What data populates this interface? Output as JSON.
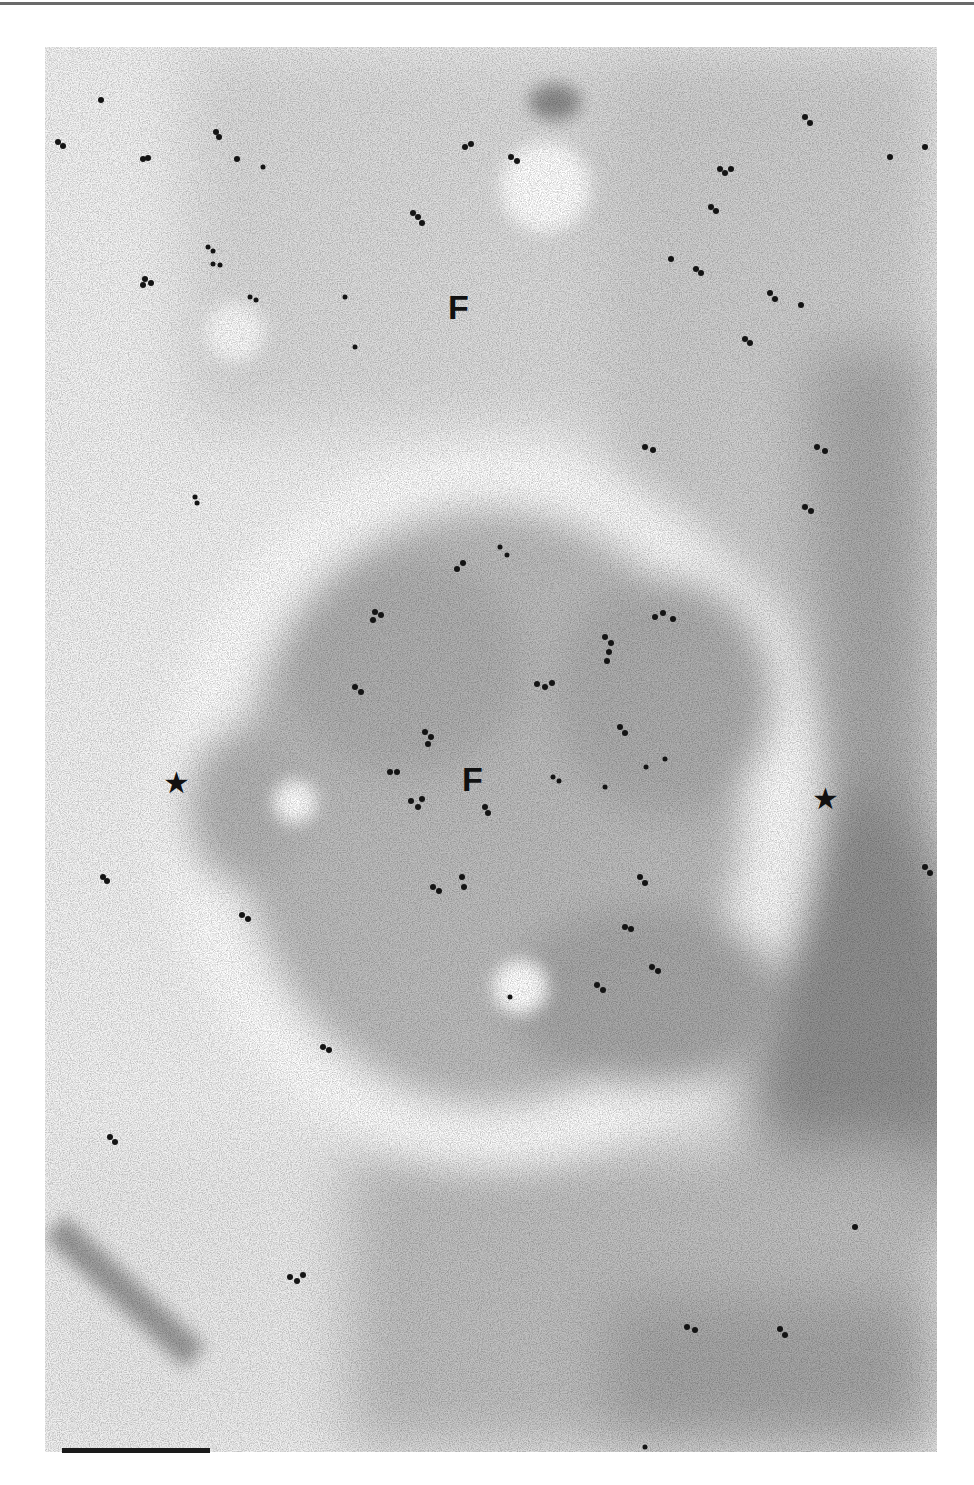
{
  "figure": {
    "type": "immunogold electron micrograph",
    "labels": [
      {
        "id": "label-f-top",
        "text": "F",
        "x": 448,
        "y": 290
      },
      {
        "id": "label-f-center",
        "text": "F",
        "x": 462,
        "y": 762
      }
    ],
    "markers": [
      {
        "id": "star-left",
        "glyph": "★",
        "x": 163,
        "y": 768
      },
      {
        "id": "star-right",
        "glyph": "★",
        "x": 812,
        "y": 784
      }
    ],
    "scale_bar": {
      "x": 62,
      "y": 1448,
      "length_px": 148,
      "label": ""
    },
    "colors": {
      "background": "#f4f4f4",
      "dense": "#8a8a8a",
      "particle": "#141414"
    }
  }
}
